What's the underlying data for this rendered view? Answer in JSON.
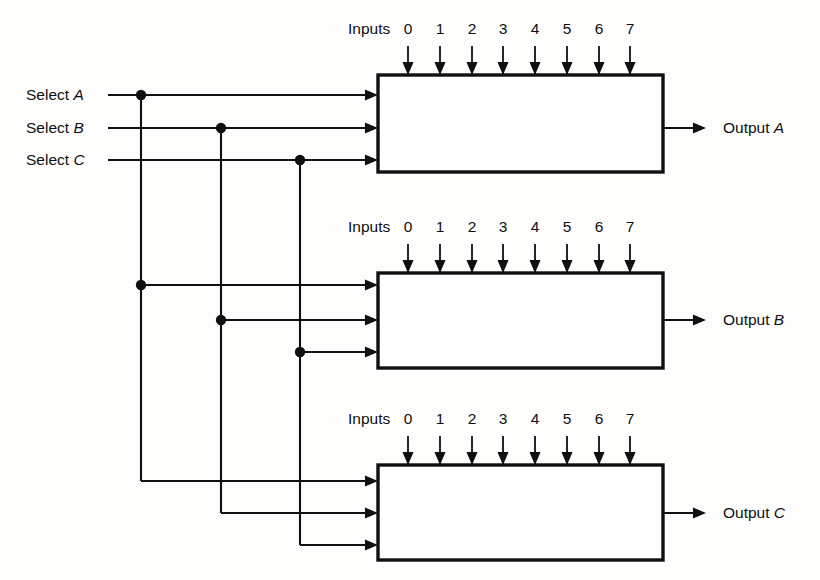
{
  "diagram": {
    "type": "logic-schematic",
    "background_color": "#fdfdfc",
    "line_color": "#101010",
    "box_fill": "#ffffff"
  },
  "select_lines": [
    {
      "id": "A",
      "label_prefix": "Select",
      "label_italic": "A",
      "y": 95,
      "bus_x": 141,
      "text_x": 26,
      "line_start_x": 108
    },
    {
      "id": "B",
      "label_prefix": "Select",
      "label_italic": "B",
      "y": 128,
      "bus_x": 221,
      "text_x": 26,
      "line_start_x": 108
    },
    {
      "id": "C",
      "label_prefix": "Select",
      "label_italic": "C",
      "y": 160,
      "bus_x": 300,
      "text_x": 26,
      "line_start_x": 108
    }
  ],
  "multiplexers": [
    {
      "id": "mux-a",
      "box": {
        "x": 378,
        "y": 75,
        "width": 285,
        "height": 97
      },
      "inputs_label": "Inputs",
      "inputs_label_x": 348,
      "inputs_label_y": 34,
      "input_numbers": [
        "0",
        "1",
        "2",
        "3",
        "4",
        "5",
        "6",
        "7"
      ],
      "input_x": [
        408,
        440,
        472,
        503,
        535,
        567,
        599,
        630
      ],
      "input_num_y": 34,
      "arrow_top_y": 46,
      "select_inputs_y": [
        95,
        128,
        160
      ],
      "select_junctions": [
        {
          "bus": "A",
          "x": 141,
          "y": 95,
          "dot": true
        },
        {
          "bus": "B",
          "x": 221,
          "y": 128,
          "dot": true
        },
        {
          "bus": "C",
          "x": 300,
          "y": 160,
          "dot": true
        }
      ],
      "output_label_prefix": "Output",
      "output_label_italic": "A",
      "output_y": 128,
      "output_line_end_x": 706,
      "output_text_x": 723
    },
    {
      "id": "mux-b",
      "box": {
        "x": 378,
        "y": 273,
        "width": 285,
        "height": 95
      },
      "inputs_label": "Inputs",
      "inputs_label_x": 348,
      "inputs_label_y": 232,
      "input_numbers": [
        "0",
        "1",
        "2",
        "3",
        "4",
        "5",
        "6",
        "7"
      ],
      "input_x": [
        408,
        440,
        472,
        503,
        535,
        567,
        599,
        630
      ],
      "input_num_y": 232,
      "arrow_top_y": 244,
      "select_inputs_y": [
        285,
        320,
        352
      ],
      "select_junctions": [
        {
          "bus": "A",
          "x": 141,
          "y": 285,
          "dot": true
        },
        {
          "bus": "B",
          "x": 221,
          "y": 320,
          "dot": true
        },
        {
          "bus": "C",
          "x": 300,
          "y": 352,
          "dot": true
        }
      ],
      "output_label_prefix": "Output",
      "output_label_italic": "B",
      "output_y": 320,
      "output_line_end_x": 706,
      "output_text_x": 723
    },
    {
      "id": "mux-c",
      "box": {
        "x": 378,
        "y": 465,
        "width": 285,
        "height": 95
      },
      "inputs_label": "Inputs",
      "inputs_label_x": 348,
      "inputs_label_y": 424,
      "input_numbers": [
        "0",
        "1",
        "2",
        "3",
        "4",
        "5",
        "6",
        "7"
      ],
      "input_x": [
        408,
        440,
        472,
        503,
        535,
        567,
        599,
        630
      ],
      "input_num_y": 424,
      "arrow_top_y": 436,
      "select_inputs_y": [
        481,
        513,
        545
      ],
      "select_junctions": [
        {
          "bus": "A",
          "x": 141,
          "y": 481,
          "dot": false
        },
        {
          "bus": "B",
          "x": 221,
          "y": 513,
          "dot": false
        },
        {
          "bus": "C",
          "x": 300,
          "y": 545,
          "dot": false
        }
      ],
      "output_label_prefix": "Output",
      "output_label_italic": "C",
      "output_y": 513,
      "output_line_end_x": 706,
      "output_text_x": 723
    }
  ],
  "geometry": {
    "box_left_x": 378,
    "box_right_x": 663,
    "arrow_size": 9,
    "dot_radius": 5.2
  }
}
